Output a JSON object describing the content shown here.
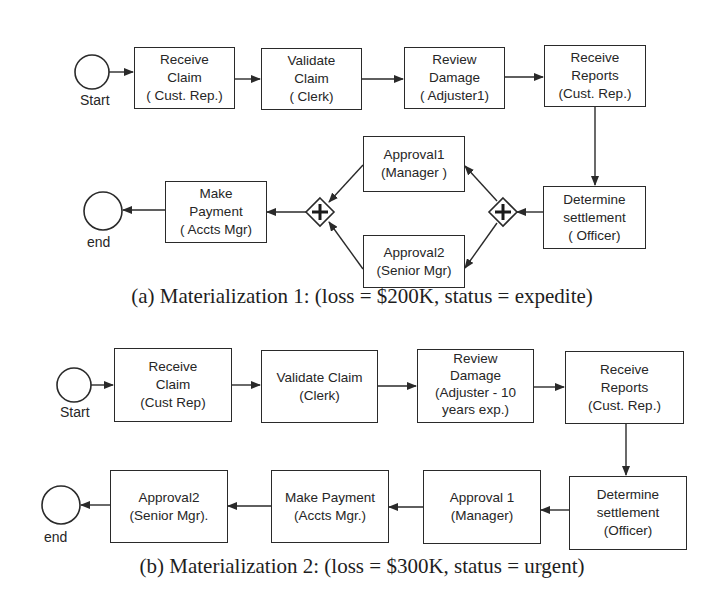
{
  "diagram_a": {
    "caption": "(a) Materialization 1: (loss = $200K, status = expedite)",
    "start_label": "Start",
    "end_label": "end",
    "tasks": {
      "receive_claim": [
        "Receive",
        "Claim",
        "( Cust. Rep.)"
      ],
      "validate_claim": [
        "Validate",
        "Claim",
        "( Clerk)"
      ],
      "review_damage": [
        "Review",
        "Damage",
        "( Adjuster1)"
      ],
      "receive_reports": [
        "Receive",
        "Reports",
        "(Cust. Rep.)"
      ],
      "determine_settlement": [
        "Determine",
        "settlement",
        "( Officer)"
      ],
      "approval1": [
        "Approval1",
        "(Manager )"
      ],
      "approval2": [
        "Approval2",
        "(Senior Mgr)"
      ],
      "make_payment": [
        "Make",
        "Payment",
        "( Accts Mgr)"
      ]
    },
    "gateways": [
      {
        "type": "parallel-split",
        "symbol": "+"
      },
      {
        "type": "parallel-join",
        "symbol": "+"
      }
    ]
  },
  "diagram_b": {
    "caption": "(b) Materialization 2: (loss = $300K, status = urgent)",
    "start_label": "Start",
    "end_label": "end",
    "tasks": {
      "receive_claim": [
        "Receive",
        "Claim",
        "(Cust Rep)"
      ],
      "validate_claim": [
        "Validate Claim",
        "(Clerk)"
      ],
      "review_damage": [
        "Review",
        "Damage",
        "(Adjuster - 10",
        "years exp.)"
      ],
      "receive_reports": [
        "Receive",
        "Reports",
        "(Cust. Rep.)"
      ],
      "determine_settlement": [
        "Determine",
        "settlement",
        "(Officer)"
      ],
      "approval1": [
        "Approval 1",
        "(Manager)"
      ],
      "make_payment": [
        "Make Payment",
        "(Accts Mgr.)"
      ],
      "approval2": [
        "Approval2",
        "(Senior Mgr)."
      ]
    }
  },
  "colors": {
    "stroke": "#2a2a2a",
    "text": "#262626",
    "background": "#ffffff"
  }
}
